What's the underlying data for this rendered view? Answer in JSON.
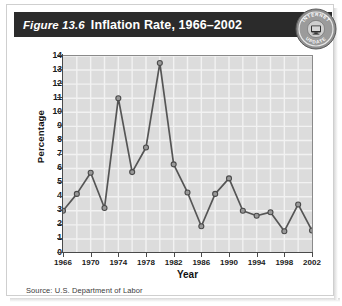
{
  "figure": {
    "number": "Figure 13.6",
    "title": "Inflation Rate, 1966–2002",
    "source": "Source: U.S. Department of Labor"
  },
  "seal": {
    "top_text": "INTERNET",
    "bottom_text": "UPDATE",
    "icon": "computer-monitor-icon"
  },
  "colors": {
    "header_bg": "#2b2b2b",
    "header_text": "#ffffff",
    "plot_bg": "#dcdcdc",
    "gridline": "#f2f2f2",
    "line": "#555555",
    "marker_fill": "#9a9a9a",
    "marker_stroke": "#4a4a4a",
    "axis": "#4a4a4a"
  },
  "chart_data": {
    "type": "line",
    "title": "Inflation Rate, 1966–2002",
    "xlabel": "Year",
    "ylabel": "Percentage",
    "xlim": [
      1966,
      2002
    ],
    "ylim": [
      0,
      14
    ],
    "ytick_labels": [
      "14",
      "13",
      "12",
      "11",
      "10",
      "9",
      "8",
      "7",
      "6",
      "5",
      "4",
      "3",
      "2",
      "1",
      "0"
    ],
    "yticks": [
      14,
      13,
      12,
      11,
      10,
      9,
      8,
      7,
      6,
      5,
      4,
      3,
      2,
      1,
      0
    ],
    "xtick_labels": [
      "1966",
      "1970",
      "1974",
      "1978",
      "1982",
      "1986",
      "1990",
      "1994",
      "1998",
      "2002"
    ],
    "xticks": [
      1966,
      1970,
      1974,
      1978,
      1982,
      1986,
      1990,
      1994,
      1998,
      2002
    ],
    "grid": true,
    "legend": null,
    "x": [
      1966,
      1968,
      1970,
      1972,
      1974,
      1976,
      1978,
      1980,
      1982,
      1984,
      1986,
      1988,
      1990,
      1992,
      1994,
      1996,
      1998,
      2000,
      2002
    ],
    "values": [
      3.0,
      4.2,
      5.7,
      3.2,
      11.0,
      5.75,
      7.5,
      13.5,
      6.3,
      4.3,
      1.9,
      4.2,
      5.3,
      3.0,
      2.65,
      2.9,
      1.55,
      3.45,
      1.6
    ],
    "series": [
      {
        "name": "Inflation Rate",
        "values": [
          3.0,
          4.2,
          5.7,
          3.2,
          11.0,
          5.75,
          7.5,
          13.5,
          6.3,
          4.3,
          1.9,
          4.2,
          5.3,
          3.0,
          2.65,
          2.9,
          1.55,
          3.45,
          1.6
        ]
      }
    ]
  }
}
